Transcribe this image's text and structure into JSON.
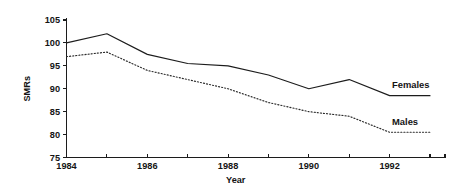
{
  "chart_data": {
    "type": "line",
    "title": "",
    "subtitle": "",
    "xlabel": "Year",
    "ylabel": "SMRs",
    "x": [
      1984,
      1985,
      1986,
      1987,
      1988,
      1989,
      1990,
      1991,
      1992,
      1993
    ],
    "xlim": [
      1984,
      1993
    ],
    "ylim": [
      75,
      105
    ],
    "yticks": [
      75,
      80,
      85,
      90,
      95,
      100,
      105
    ],
    "ytick_labels": [
      "75",
      "80",
      "85",
      "90",
      "95",
      "100",
      "105"
    ],
    "xticks": [
      1984,
      1985,
      1986,
      1987,
      1988,
      1989,
      1990,
      1991,
      1992,
      1993
    ],
    "xtick_labels": [
      "1984",
      "",
      "1986",
      "",
      "1988",
      "",
      "1990",
      "",
      "1992",
      ""
    ],
    "grid": false,
    "legend_position": "inline-right",
    "series": [
      {
        "name": "Females",
        "style": "solid",
        "color": "#1c1c1c",
        "label_x": 1993,
        "values": [
          100,
          102,
          97.5,
          95.5,
          95,
          93,
          90,
          92,
          88.5,
          88.5
        ]
      },
      {
        "name": "Males",
        "style": "dotted",
        "color": "#2a2a2a",
        "label_x": 1993,
        "values": [
          97,
          98,
          94,
          92,
          90,
          87,
          85,
          84,
          80.5,
          80.5
        ]
      }
    ],
    "annotations": []
  },
  "labels": {
    "females": "Females",
    "males": "Males",
    "y_axis_title": "SMRs",
    "x_axis_title": "Year"
  }
}
